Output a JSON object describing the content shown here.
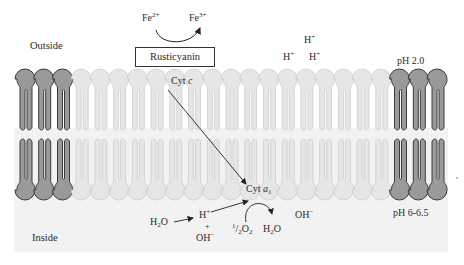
{
  "diagram": {
    "regions": {
      "outside_label": "Outside",
      "inside_label": "Inside"
    },
    "ph": {
      "outside": "pH 2.0",
      "inside": "pH 6-6.5"
    },
    "iron": {
      "reactant": "Fe",
      "reactant_charge": "2+",
      "product": "Fe",
      "product_charge": "3+"
    },
    "proteins": {
      "rusticyanin": "Rusticyanin",
      "cyt_c_prefix": "Cyt ",
      "cyt_c_italic": "c",
      "cyt_a1_prefix": "Cyt ",
      "cyt_a1_italic": "a",
      "cyt_a1_sub": "1"
    },
    "outside_protons": [
      {
        "symbol": "H",
        "charge": "+"
      },
      {
        "symbol": "H",
        "charge": "+"
      },
      {
        "symbol": "H",
        "charge": "+"
      }
    ],
    "inside_species": {
      "water_in": "H",
      "water_in_sub": "2",
      "water_in_tail": "O",
      "proton": "H",
      "proton_charge": "+",
      "plus": "+",
      "hydroxide": "OH",
      "hydroxide_charge": "−",
      "oxygen_coef_num": "1",
      "oxygen_coef_den": "/",
      "oxygen_coef_2": "2",
      "oxygen": "O",
      "oxygen_sub": "2",
      "water_out": "H",
      "water_out_sub": "2",
      "water_out_tail": "O",
      "free_hydroxide": "OH",
      "free_hydroxide_charge": "−"
    },
    "membrane": {
      "dark_lipids_left": 3,
      "light_lipids": 17,
      "dark_lipids_right": 3,
      "dark_color": "#9a9a9a",
      "light_color": "#e6e6e6",
      "inside_bg": "#f3f3f3"
    }
  }
}
